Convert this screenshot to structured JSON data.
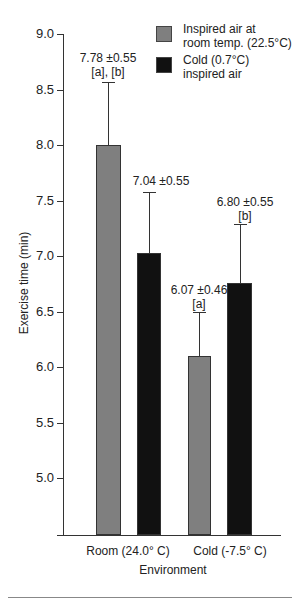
{
  "chart_data": {
    "type": "bar",
    "title": "",
    "xlabel": "Environment",
    "ylabel": "Exercise time (min)",
    "ylim": [
      4.5,
      9.0
    ],
    "yticks": [
      "9.0",
      "8.5",
      "8.0",
      "7.5",
      "7.0",
      "6.5",
      "6.0",
      "5.5",
      "5.0"
    ],
    "grid": false,
    "legend_position": "top-right",
    "categories": [
      "Room (24.0° C)",
      "Cold (-7.5° C)"
    ],
    "series": [
      {
        "name": "Inspired air at room temp. (22.5°C)",
        "color": "#7f7f7f",
        "values": [
          7.98,
          6.08
        ],
        "error_bars": [
          0.58,
          0.4
        ],
        "annotations": [
          [
            "7.78 ±0.55",
            "[a], [b]"
          ],
          [
            "6.07 ±0.46",
            "[a]"
          ]
        ]
      },
      {
        "name": "Cold (0.7°C) inspired air",
        "color": "#111111",
        "values": [
          7.01,
          6.75
        ],
        "error_bars": [
          0.56,
          0.53
        ],
        "annotations": [
          [
            "7.04 ±0.55"
          ],
          [
            "6.80 ±0.55",
            "[b]"
          ]
        ]
      }
    ]
  },
  "legend": {
    "items": [
      {
        "line1": "Inspired air at",
        "line2": "room temp. (22.5°C)"
      },
      {
        "line1": "Cold (0.7°C)",
        "line2": "inspired air"
      }
    ]
  },
  "annotations": {
    "b1_l1": "7.78 ±0.55",
    "b1_l2": "[a], [b]",
    "b2_l1": "7.04 ±0.55",
    "b3_l1": "6.07 ±0.46",
    "b3_l2": "[a]",
    "b4_l1": "6.80 ±0.55",
    "b4_l2": "[b]"
  }
}
